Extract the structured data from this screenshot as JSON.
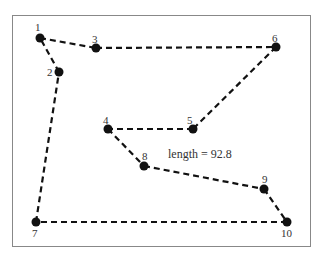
{
  "diagram": {
    "title": "",
    "annotation": "length = 92.8",
    "tour_order": [
      "1",
      "3",
      "6",
      "5",
      "4",
      "8",
      "9",
      "10",
      "7",
      "2",
      "1"
    ],
    "nodes": [
      {
        "id": "1",
        "label": "1",
        "x": 40,
        "y": 38
      },
      {
        "id": "2",
        "label": "2",
        "x": 59,
        "y": 72
      },
      {
        "id": "3",
        "label": "3",
        "x": 96,
        "y": 48
      },
      {
        "id": "4",
        "label": "4",
        "x": 108,
        "y": 129
      },
      {
        "id": "5",
        "label": "5",
        "x": 193,
        "y": 129
      },
      {
        "id": "6",
        "label": "6",
        "x": 276,
        "y": 47
      },
      {
        "id": "7",
        "label": "7",
        "x": 36,
        "y": 222
      },
      {
        "id": "8",
        "label": "8",
        "x": 144,
        "y": 166
      },
      {
        "id": "9",
        "label": "9",
        "x": 264,
        "y": 189
      },
      {
        "id": "10",
        "label": "10",
        "x": 287,
        "y": 222
      }
    ],
    "colors": {
      "frame": "#888888",
      "edge": "#111111",
      "node": "#111111",
      "text": "#333333"
    }
  }
}
